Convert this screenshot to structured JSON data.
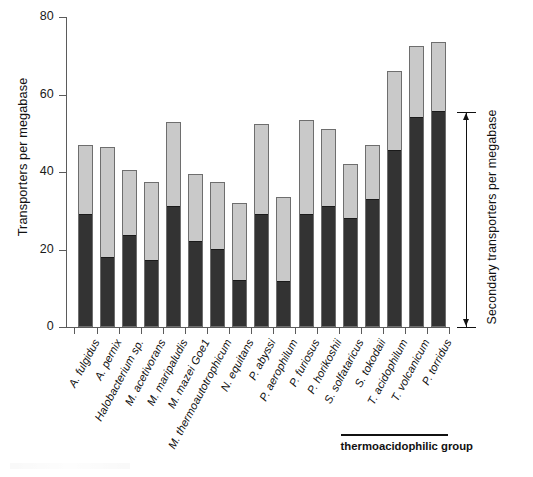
{
  "chart_data": {
    "type": "bar",
    "title": "",
    "subtitle": "",
    "xlabel": "",
    "ylabel": "Transporters per megabase",
    "ylim": [
      0,
      80
    ],
    "yticks": [
      0,
      20,
      40,
      60,
      80
    ],
    "grid": false,
    "stacked": true,
    "legend_position": "none",
    "categories": [
      "A. fulgidus",
      "A. pernix",
      "Halobacterium sp.",
      "M. acetivorans",
      "M. maripaludis",
      "M. mazei Goe1",
      "M. thermoautotrophicum",
      "N. equitans",
      "P. abyssi",
      "P. aerophilum",
      "P. furiosus",
      "P. horikoshii",
      "S. solfataricus",
      "S. tokodaii",
      "T. acidophilum",
      "T. volcanicum",
      "P. torridus"
    ],
    "series": [
      {
        "name": "Secondary transporters per megabase",
        "color": "#333333",
        "values": [
          29.0,
          17.8,
          23.5,
          17.0,
          31.0,
          22.0,
          20.0,
          12.0,
          29.0,
          11.5,
          29.0,
          31.0,
          27.8,
          32.8,
          45.5,
          54.0,
          55.5
        ]
      },
      {
        "name": "Other transporters per megabase",
        "color": "#c9c9c9",
        "values": [
          18.0,
          28.7,
          17.0,
          20.5,
          22.0,
          17.5,
          17.5,
          20.0,
          23.5,
          22.0,
          24.5,
          20.0,
          14.2,
          14.2,
          20.5,
          18.5,
          18.0
        ]
      }
    ],
    "totals": [
      47.0,
      46.5,
      40.5,
      37.5,
      53.0,
      39.5,
      37.5,
      32.0,
      52.5,
      33.5,
      53.5,
      51.0,
      42.0,
      47.0,
      66.0,
      72.5,
      73.5
    ],
    "annotations": [
      {
        "name": "group-bracket",
        "label": "thermoacidophilic group",
        "covers": [
          "S. solfataricus",
          "S. tokodaii",
          "T. acidophilum",
          "T. volcanicum",
          "P. torridus"
        ]
      },
      {
        "name": "secondary-range-arrow",
        "label": "Secondary transporters per megabase",
        "from": 0,
        "to": 55.5
      }
    ]
  },
  "axis": {
    "y_title": "Transporters per megabase",
    "y_tick_labels": [
      "80",
      "60",
      "40",
      "20",
      "0"
    ]
  },
  "group_bracket": {
    "label": "thermoacidophilic group"
  },
  "right_annotation": {
    "label": "Secondary transporters per megabase"
  },
  "colors": {
    "secondary_fill": "#333333",
    "other_fill": "#c9c9c9",
    "bar_stroke": "#6e6e6e",
    "axis": "#5b5b5b",
    "text": "#111111",
    "background": "#ffffff"
  }
}
